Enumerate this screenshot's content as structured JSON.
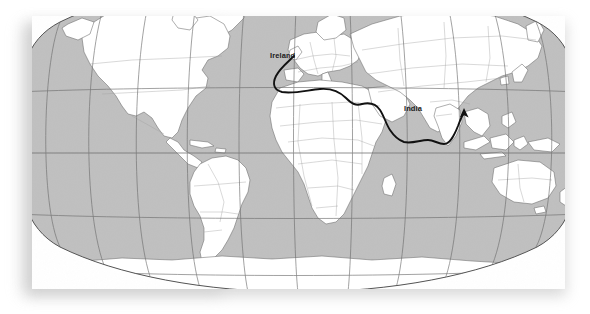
{
  "figure": {
    "type": "map",
    "projection": "robinson",
    "background_color": "#ffffff",
    "card_color": "#ffffff",
    "ocean_color": "#c3c3c3",
    "land_color": "#ffffff",
    "coastline_color": "#555555",
    "border_color": "#9a9a9a",
    "graticule_color": "#6e6e6e",
    "route_color": "#111111"
  },
  "labels": [
    {
      "id": "ireland",
      "text": "Ireland",
      "role": "route-origin"
    },
    {
      "id": "india",
      "text": "India",
      "role": "route-destination"
    }
  ],
  "route": {
    "name": "Ireland to India sea route",
    "origin": "Ireland",
    "destination": "India",
    "arrowhead": "at-destination",
    "waypoints": [
      "Ireland",
      "Bay of Biscay",
      "Strait of Gibraltar",
      "Mediterranean Sea",
      "Suez",
      "Red Sea",
      "Gulf of Aden",
      "Arabian Sea",
      "India"
    ]
  },
  "graticule": {
    "meridian_spacing_degrees": 30,
    "parallel_spacing_degrees": 30,
    "equator_shown": true
  },
  "continents": [
    "North America",
    "South America",
    "Europe",
    "Africa",
    "Asia",
    "Australia",
    "Antarctica",
    "Greenland"
  ]
}
